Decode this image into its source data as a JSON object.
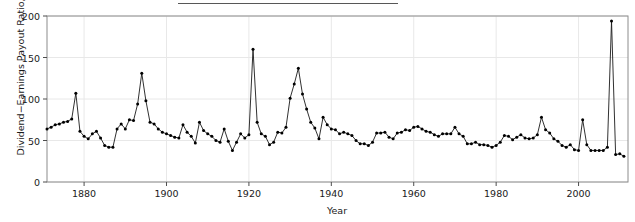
{
  "figure": {
    "title_remnant": "Dividend Payout Ratio for the S&P Composite Index",
    "background_color": "#ffffff",
    "line_color": "#1a1a1a",
    "marker_color": "#000000",
    "grid_color": "#e8e8e8",
    "axis_color": "#8c8c8c"
  },
  "chart_data": {
    "type": "line",
    "title": "",
    "xlabel": "Year",
    "ylabel": "Dividend−Earnings Payout Ratio, in %",
    "xlim": [
      1871,
      2012
    ],
    "ylim": [
      0,
      200
    ],
    "xticks": [
      1880,
      1900,
      1920,
      1940,
      1960,
      1980,
      2000
    ],
    "yticks": [
      0,
      50,
      100,
      150,
      200
    ],
    "xtick_labels": [
      "1880",
      "1900",
      "1920",
      "1940",
      "1960",
      "1980",
      "2000"
    ],
    "ytick_labels": [
      "0",
      "50",
      "100",
      "150",
      "200"
    ],
    "grid": true,
    "legend": false,
    "markers": "filled-circle",
    "series": [
      {
        "name": "Dividend-Earnings Payout Ratio",
        "x": [
          1871,
          1872,
          1873,
          1874,
          1875,
          1876,
          1877,
          1878,
          1879,
          1880,
          1881,
          1882,
          1883,
          1884,
          1885,
          1886,
          1887,
          1888,
          1889,
          1890,
          1891,
          1892,
          1893,
          1894,
          1895,
          1896,
          1897,
          1898,
          1899,
          1900,
          1901,
          1902,
          1903,
          1904,
          1905,
          1906,
          1907,
          1908,
          1909,
          1910,
          1911,
          1912,
          1913,
          1914,
          1915,
          1916,
          1917,
          1918,
          1919,
          1920,
          1921,
          1922,
          1923,
          1924,
          1925,
          1926,
          1927,
          1928,
          1929,
          1930,
          1931,
          1932,
          1933,
          1934,
          1935,
          1936,
          1937,
          1938,
          1939,
          1940,
          1941,
          1942,
          1943,
          1944,
          1945,
          1946,
          1947,
          1948,
          1949,
          1950,
          1951,
          1952,
          1953,
          1954,
          1955,
          1956,
          1957,
          1958,
          1959,
          1960,
          1961,
          1962,
          1963,
          1964,
          1965,
          1966,
          1967,
          1968,
          1969,
          1970,
          1971,
          1972,
          1973,
          1974,
          1975,
          1976,
          1977,
          1978,
          1979,
          1980,
          1981,
          1982,
          1983,
          1984,
          1985,
          1986,
          1987,
          1988,
          1989,
          1990,
          1991,
          1992,
          1993,
          1994,
          1995,
          1996,
          1997,
          1998,
          1999,
          2000,
          2001,
          2002,
          2003,
          2004,
          2005,
          2006,
          2007,
          2008,
          2009,
          2010,
          2011
        ],
        "y": [
          64,
          66,
          69,
          70,
          72,
          73,
          76,
          107,
          61,
          55,
          52,
          58,
          61,
          53,
          44,
          42,
          42,
          64,
          70,
          64,
          75,
          74,
          94,
          131,
          98,
          72,
          70,
          64,
          60,
          58,
          56,
          54,
          53,
          69,
          60,
          55,
          47,
          72,
          62,
          58,
          55,
          50,
          48,
          64,
          49,
          38,
          48,
          58,
          53,
          57,
          160,
          72,
          58,
          55,
          45,
          48,
          60,
          59,
          66,
          101,
          118,
          137,
          106,
          88,
          72,
          65,
          52,
          78,
          69,
          64,
          63,
          58,
          60,
          58,
          56,
          50,
          46,
          46,
          44,
          48,
          59,
          59,
          60,
          54,
          52,
          59,
          60,
          63,
          62,
          66,
          67,
          64,
          61,
          60,
          57,
          55,
          58,
          58,
          58,
          66,
          58,
          55,
          46,
          46,
          48,
          45,
          45,
          44,
          42,
          44,
          48,
          56,
          55,
          51,
          54,
          57,
          53,
          52,
          53,
          57,
          78,
          63,
          59,
          52,
          49,
          44,
          42,
          45,
          39,
          38,
          75,
          45,
          38,
          38,
          38,
          38,
          42,
          194,
          33,
          34,
          31
        ]
      }
    ]
  },
  "y_axis": {
    "ticks": [
      {
        "value": 200,
        "label": "200"
      },
      {
        "value": 150,
        "label": "150"
      },
      {
        "value": 100,
        "label": "100"
      },
      {
        "value": 50,
        "label": "50"
      },
      {
        "value": 0,
        "label": "0"
      }
    ]
  },
  "x_axis": {
    "ticks": [
      {
        "value": 1880,
        "label": "1880"
      },
      {
        "value": 1900,
        "label": "1900"
      },
      {
        "value": 1920,
        "label": "1920"
      },
      {
        "value": 1940,
        "label": "1940"
      },
      {
        "value": 1960,
        "label": "1960"
      },
      {
        "value": 1980,
        "label": "1980"
      },
      {
        "value": 2000,
        "label": "2000"
      }
    ]
  }
}
